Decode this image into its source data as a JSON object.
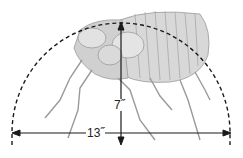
{
  "diagram": {
    "height_label": "7˝",
    "width_label": "13˝",
    "colors": {
      "line": "#1a1a1a",
      "illustration": "#9a9a9a",
      "illustration_fill": "#d6d6d6",
      "background": "#ffffff"
    }
  }
}
